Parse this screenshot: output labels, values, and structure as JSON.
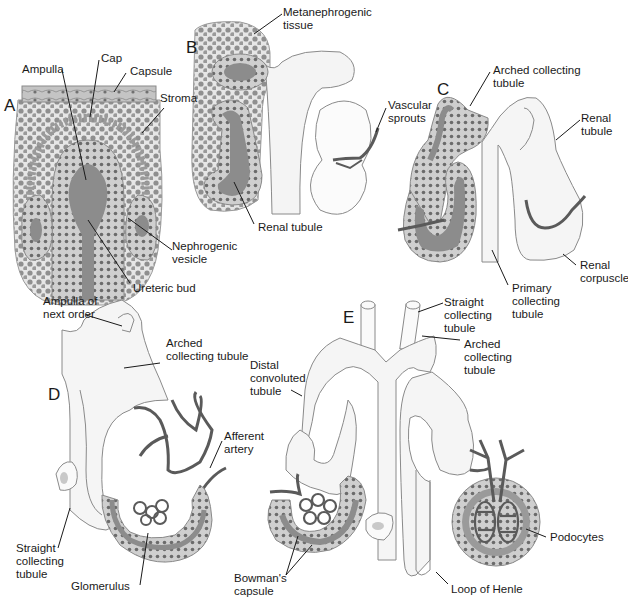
{
  "figure": {
    "colors": {
      "background": "#ffffff",
      "tissue_fill": "#f2f2f2",
      "tissue_outline": "#8a8a8a",
      "cell_fill": "#bdbdbd",
      "cell_nucleus": "#6b6b6b",
      "lumen_fill": "#8c8c8c",
      "vessel": "#5a5a5a",
      "leader_line": "#1a1a1a",
      "text": "#1a1a1a"
    }
  },
  "panels": {
    "A": {
      "letter": "A",
      "labels": {
        "ampulla": "Ampulla",
        "cap": "Cap",
        "capsule": "Capsule",
        "stroma": "Stroma",
        "nephrogenic_vesicle": "Nephrogenic\nvesicle",
        "ureteric_bud": "Ureteric bud"
      }
    },
    "B": {
      "letter": "B",
      "labels": {
        "metanephrogenic_tissue": "Metanephrogenic\ntissue",
        "vascular_sprouts": "Vascular\nsprouts",
        "renal_tubule": "Renal tubule"
      }
    },
    "C": {
      "letter": "C",
      "labels": {
        "arched_collecting_tubule": "Arched collecting\ntubule",
        "renal_tubule": "Renal\ntubule",
        "renal_corpuscle": "Renal\ncorpuscle",
        "primary_collecting_tubule": "Primary\ncollecting\ntubule"
      }
    },
    "D": {
      "letter": "D",
      "labels": {
        "ampulla_next_order": "Ampulla of\nnext order",
        "arched_collecting_tubule": "Arched\ncollecting tubule",
        "afferent_artery": "Afferent\nartery",
        "straight_collecting_tubule": "Straight\ncollecting\ntubule",
        "glomerulus": "Glomerulus"
      }
    },
    "E": {
      "letter": "E",
      "labels": {
        "straight_collecting_tubule": "Straight\ncollecting\ntubule",
        "arched_collecting_tubule": "Arched\ncollecting\ntubule",
        "distal_convoluted_tubule": "Distal\nconvoluted\ntubule",
        "bowmans_capsule": "Bowman's\ncapsule",
        "loop_of_henle": "Loop of Henle",
        "podocytes": "Podocytes"
      }
    }
  }
}
